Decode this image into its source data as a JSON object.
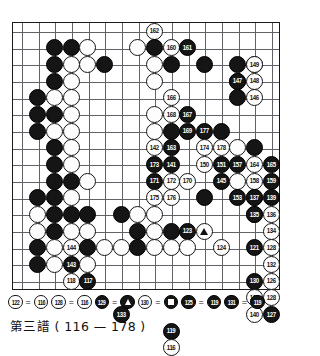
{
  "caption": "第三譜 ( 116 — 178 )",
  "board": {
    "cols": 15,
    "rows": 15,
    "line_color": "#5f6368",
    "border_color": "#1a1a1a",
    "black_color": "#151515",
    "white_color": "#fdfdfd"
  },
  "legend": {
    "items": [
      {
        "left": {
          "num": "122",
          "color": "white"
        },
        "eq": "=",
        "right": {
          "num": "116",
          "color": "white"
        }
      },
      {
        "left": {
          "num": "128",
          "color": "white"
        },
        "eq": "=",
        "right": {
          "num": "116",
          "color": "white"
        }
      },
      {
        "left": {
          "num": "129",
          "color": "black"
        },
        "eq": "=",
        "right": {
          "marker": "triangle",
          "color": "black"
        }
      },
      {
        "left": {
          "num": "130",
          "color": "white"
        },
        "eq": "=",
        "right": {
          "marker": "square",
          "color": "black"
        }
      },
      {
        "left": {
          "num": "125",
          "color": "black"
        },
        "eq": "=",
        "right": {
          "num": "119",
          "color": "black"
        }
      },
      {
        "left": {
          "num": "131",
          "color": "black"
        },
        "eq": "=",
        "right": {
          "num": "119",
          "color": "black"
        }
      }
    ]
  },
  "stones": [
    {
      "c": 8,
      "r": 0,
      "color": "white",
      "num": "162"
    },
    {
      "c": 7,
      "r": 1,
      "color": "white",
      "num": ""
    },
    {
      "c": 8,
      "r": 1,
      "color": "black",
      "num": ""
    },
    {
      "c": 9,
      "r": 1,
      "color": "white",
      "num": "160"
    },
    {
      "c": 10,
      "r": 1,
      "color": "black",
      "num": "161"
    },
    {
      "c": 2,
      "r": 1,
      "color": "black",
      "num": ""
    },
    {
      "c": 3,
      "r": 1,
      "color": "black",
      "num": ""
    },
    {
      "c": 4,
      "r": 1,
      "color": "white",
      "num": ""
    },
    {
      "c": 2,
      "r": 2,
      "color": "black",
      "num": ""
    },
    {
      "c": 3,
      "r": 2,
      "color": "white",
      "num": ""
    },
    {
      "c": 4,
      "r": 2,
      "color": "white",
      "num": ""
    },
    {
      "c": 5,
      "r": 2,
      "color": "black",
      "num": ""
    },
    {
      "c": 8,
      "r": 2,
      "color": "white",
      "num": ""
    },
    {
      "c": 9,
      "r": 2,
      "color": "black",
      "num": ""
    },
    {
      "c": 11,
      "r": 2,
      "color": "black",
      "num": ""
    },
    {
      "c": 13,
      "r": 2,
      "color": "black",
      "num": ""
    },
    {
      "c": 14,
      "r": 2,
      "color": "white",
      "num": ""
    },
    {
      "c": 2,
      "r": 3,
      "color": "black",
      "num": ""
    },
    {
      "c": 3,
      "r": 3,
      "color": "white",
      "num": ""
    },
    {
      "c": 8,
      "r": 3,
      "color": "white",
      "num": ""
    },
    {
      "c": 13,
      "r": 3,
      "color": "black",
      "num": ""
    },
    {
      "c": 1,
      "r": 4,
      "color": "black",
      "num": ""
    },
    {
      "c": 2,
      "r": 4,
      "color": "white",
      "num": ""
    },
    {
      "c": 3,
      "r": 4,
      "color": "white",
      "num": ""
    },
    {
      "c": 9,
      "r": 4,
      "color": "white",
      "num": "166"
    },
    {
      "c": 13,
      "r": 4,
      "color": "black",
      "num": ""
    },
    {
      "c": 1,
      "r": 5,
      "color": "black",
      "num": ""
    },
    {
      "c": 2,
      "r": 5,
      "color": "black",
      "num": ""
    },
    {
      "c": 3,
      "r": 5,
      "color": "white",
      "num": ""
    },
    {
      "c": 8,
      "r": 5,
      "color": "white",
      "num": ""
    },
    {
      "c": 9,
      "r": 5,
      "color": "white",
      "num": "168"
    },
    {
      "c": 10,
      "r": 5,
      "color": "black",
      "num": "167"
    },
    {
      "c": 1,
      "r": 6,
      "color": "black",
      "num": ""
    },
    {
      "c": 2,
      "r": 6,
      "color": "white",
      "num": ""
    },
    {
      "c": 3,
      "r": 6,
      "color": "white",
      "num": ""
    },
    {
      "c": 8,
      "r": 6,
      "color": "white",
      "num": ""
    },
    {
      "c": 9,
      "r": 6,
      "color": "black",
      "num": ""
    },
    {
      "c": 10,
      "r": 6,
      "color": "black",
      "num": "169"
    },
    {
      "c": 11,
      "r": 6,
      "color": "black",
      "num": "177"
    },
    {
      "c": 12,
      "r": 6,
      "color": "black",
      "num": ""
    },
    {
      "c": 2,
      "r": 7,
      "color": "black",
      "num": ""
    },
    {
      "c": 3,
      "r": 7,
      "color": "white",
      "num": ""
    },
    {
      "c": 8,
      "r": 7,
      "color": "white",
      "num": "142"
    },
    {
      "c": 9,
      "r": 7,
      "color": "black",
      "num": "163"
    },
    {
      "c": 11,
      "r": 7,
      "color": "white",
      "num": "174"
    },
    {
      "c": 12,
      "r": 7,
      "color": "white",
      "num": "178"
    },
    {
      "c": 13,
      "r": 7,
      "color": "white",
      "num": ""
    },
    {
      "c": 14,
      "r": 7,
      "color": "black",
      "num": ""
    },
    {
      "c": 2,
      "r": 8,
      "color": "black",
      "num": ""
    },
    {
      "c": 3,
      "r": 8,
      "color": "white",
      "num": ""
    },
    {
      "c": 8,
      "r": 8,
      "color": "black",
      "num": "173"
    },
    {
      "c": 9,
      "r": 8,
      "color": "black",
      "num": "141"
    },
    {
      "c": 11,
      "r": 8,
      "color": "white",
      "num": "150"
    },
    {
      "c": 12,
      "r": 8,
      "color": "black",
      "num": "151"
    },
    {
      "c": 13,
      "r": 8,
      "color": "black",
      "num": "157"
    },
    {
      "c": 14,
      "r": 8,
      "color": "white",
      "num": "164"
    },
    {
      "c": 2,
      "r": 9,
      "color": "black",
      "num": ""
    },
    {
      "c": 3,
      "r": 9,
      "color": "black",
      "num": ""
    },
    {
      "c": 4,
      "r": 9,
      "color": "white",
      "num": ""
    },
    {
      "c": 8,
      "r": 9,
      "color": "black",
      "num": "171"
    },
    {
      "c": 9,
      "r": 9,
      "color": "white",
      "num": "172"
    },
    {
      "c": 10,
      "r": 9,
      "color": "white",
      "num": "170"
    },
    {
      "c": 12,
      "r": 9,
      "color": "black",
      "num": "145"
    },
    {
      "c": 13,
      "r": 9,
      "color": "white",
      "num": ""
    },
    {
      "c": 14,
      "r": 9,
      "color": "white",
      "num": "158"
    },
    {
      "c": 1,
      "r": 10,
      "color": "black",
      "num": ""
    },
    {
      "c": 2,
      "r": 10,
      "color": "black",
      "num": ""
    },
    {
      "c": 3,
      "r": 10,
      "color": "white",
      "num": ""
    },
    {
      "c": 8,
      "r": 10,
      "color": "white",
      "num": "175"
    },
    {
      "c": 9,
      "r": 10,
      "color": "white",
      "num": "176"
    },
    {
      "c": 11,
      "r": 10,
      "color": "black",
      "num": ""
    },
    {
      "c": 13,
      "r": 10,
      "color": "black",
      "num": "153"
    },
    {
      "c": 14,
      "r": 10,
      "color": "white",
      "num": "154"
    },
    {
      "c": 1,
      "r": 11,
      "color": "white",
      "num": ""
    },
    {
      "c": 2,
      "r": 11,
      "color": "black",
      "num": ""
    },
    {
      "c": 3,
      "r": 11,
      "color": "black",
      "num": ""
    },
    {
      "c": 4,
      "r": 11,
      "color": "black",
      "num": ""
    },
    {
      "c": 6,
      "r": 11,
      "color": "black",
      "num": ""
    },
    {
      "c": 7,
      "r": 11,
      "color": "white",
      "num": ""
    },
    {
      "c": 8,
      "r": 11,
      "color": "white",
      "num": ""
    },
    {
      "c": 14,
      "r": 11,
      "color": "white",
      "num": "156"
    },
    {
      "c": 1,
      "r": 12,
      "color": "white",
      "num": ""
    },
    {
      "c": 2,
      "r": 12,
      "color": "black",
      "num": ""
    },
    {
      "c": 3,
      "r": 12,
      "color": "white",
      "num": ""
    },
    {
      "c": 4,
      "r": 12,
      "color": "white",
      "num": ""
    },
    {
      "c": 7,
      "r": 12,
      "color": "black",
      "num": ""
    },
    {
      "c": 8,
      "r": 12,
      "color": "white",
      "num": ""
    },
    {
      "c": 9,
      "r": 12,
      "color": "black",
      "num": ""
    },
    {
      "c": 10,
      "r": 12,
      "color": "black",
      "num": "123"
    },
    {
      "c": 1,
      "r": 13,
      "color": "black",
      "num": ""
    },
    {
      "c": 2,
      "r": 13,
      "color": "white",
      "num": ""
    },
    {
      "c": 3,
      "r": 13,
      "color": "white",
      "num": "144"
    },
    {
      "c": 4,
      "r": 13,
      "color": "black",
      "num": ""
    },
    {
      "c": 5,
      "r": 13,
      "color": "white",
      "num": ""
    },
    {
      "c": 6,
      "r": 13,
      "color": "white",
      "num": ""
    },
    {
      "c": 7,
      "r": 13,
      "color": "black",
      "num": ""
    },
    {
      "c": 8,
      "r": 13,
      "color": "white",
      "num": ""
    },
    {
      "c": 9,
      "r": 13,
      "color": "white",
      "num": ""
    },
    {
      "c": 10,
      "r": 13,
      "color": "white",
      "num": ""
    },
    {
      "c": 1,
      "r": 14,
      "color": "black",
      "num": ""
    },
    {
      "c": 2,
      "r": 14,
      "color": "white",
      "num": ""
    },
    {
      "c": 3,
      "r": 14,
      "color": "black",
      "num": "143"
    },
    {
      "c": 4,
      "r": 14,
      "color": "white",
      "num": ""
    }
  ],
  "numbered_overlays": [
    {
      "c": 11,
      "r": 12,
      "color": "white",
      "marker": "triangle"
    },
    {
      "c": 12,
      "r": 13,
      "color": "white",
      "num": "124"
    },
    {
      "c": 3,
      "r": 15,
      "color": "white",
      "num": "118"
    },
    {
      "c": 4,
      "r": 15,
      "color": "black",
      "num": "117"
    },
    {
      "c": 14,
      "r": 2,
      "color": "white",
      "num": "149"
    },
    {
      "c": 13,
      "r": 3,
      "color": "black",
      "num": "147"
    },
    {
      "c": 14,
      "r": 3,
      "color": "white",
      "num": "148"
    },
    {
      "c": 14,
      "r": 4,
      "color": "white",
      "num": "146"
    },
    {
      "c": 15,
      "r": 8,
      "color": "black",
      "num": "165"
    },
    {
      "c": 15,
      "r": 9,
      "color": "black",
      "num": "159"
    },
    {
      "c": 14,
      "r": 11,
      "color": "black",
      "num": "135"
    },
    {
      "c": 15,
      "r": 11,
      "color": "white",
      "num": "136"
    },
    {
      "c": 15,
      "r": 12,
      "color": "white",
      "num": "134"
    },
    {
      "c": 14,
      "r": 13,
      "color": "black",
      "num": "121"
    },
    {
      "c": 15,
      "r": 13,
      "color": "white",
      "num": "128"
    },
    {
      "c": 15,
      "r": 14,
      "color": "white",
      "num": "132"
    },
    {
      "c": 14,
      "r": 15,
      "color": "black",
      "num": "130"
    },
    {
      "c": 15,
      "r": 15,
      "color": "white",
      "num": "126"
    },
    {
      "c": 14,
      "r": 16,
      "color": "white",
      "num": "138"
    },
    {
      "c": 15,
      "r": 16,
      "color": "white",
      "num": "128"
    },
    {
      "c": 14,
      "r": 17,
      "color": "white",
      "num": "140"
    },
    {
      "c": 15,
      "r": 17,
      "color": "black",
      "num": "127"
    },
    {
      "c": 6,
      "r": 17,
      "color": "black",
      "num": "133"
    },
    {
      "c": 9,
      "r": 18,
      "color": "black",
      "num": "119"
    },
    {
      "c": 9,
      "r": 19,
      "color": "white",
      "num": "116"
    },
    {
      "c": 14,
      "r": 10,
      "color": "black",
      "num": "137"
    },
    {
      "c": 15,
      "r": 10,
      "color": "black",
      "num": "139"
    }
  ],
  "move_range": {
    "first": "116",
    "last": "178"
  }
}
